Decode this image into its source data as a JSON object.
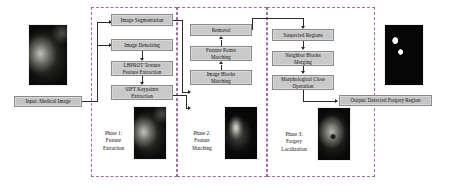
{
  "diagram": {
    "accent_dashed": "#a06ea0",
    "box_fill": "#c9c9c9",
    "line_color": "#2a2a2a"
  },
  "io": {
    "input_label": "Input: Medical Image",
    "output_label": "Output: Detected Forgery Region",
    "input_image_name": "medical-ultrasound-image",
    "output_image_name": "binary-forgery-mask-image"
  },
  "phases": [
    {
      "id": "phase1",
      "caption": "Phase 1:\nFeature\nExtraction",
      "thumb_name": "phase1-thumbnail",
      "steps": [
        {
          "label": "Image Segmentation"
        },
        {
          "label": "Image Denoising"
        },
        {
          "label": "LBPROT Texture\nFeature Extraction"
        },
        {
          "label": "SIFT Keypoints\nExtraction"
        }
      ]
    },
    {
      "id": "phase2",
      "caption": "Phase 2:\nFeature\nMatching",
      "thumb_name": "phase2-thumbnail",
      "steps": [
        {
          "label": "Removal"
        },
        {
          "label": "Feature Points\nMatching"
        },
        {
          "label": "Image Blocks\nMatching"
        }
      ]
    },
    {
      "id": "phase3",
      "caption": "Phase 3:\nForgery\nLocalization",
      "thumb_name": "phase3-thumbnail",
      "steps": [
        {
          "label": "Suspected Regions"
        },
        {
          "label": "Neighbor Blocks\nMerging"
        },
        {
          "label": "Morphological Close\nOperation"
        }
      ]
    }
  ]
}
